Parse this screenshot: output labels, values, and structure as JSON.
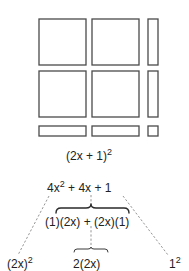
{
  "figure": {
    "area_model": {
      "caption": "(2x + 1)",
      "caption_exponent": "2",
      "tiles": [
        {
          "kind": "x-squared",
          "label": "large-square",
          "x": 39,
          "y": 19,
          "w": 47,
          "h": 46
        },
        {
          "kind": "x-squared",
          "label": "large-square",
          "x": 92,
          "y": 19,
          "w": 47,
          "h": 46
        },
        {
          "kind": "x",
          "label": "tall-strip",
          "x": 148,
          "y": 19,
          "w": 10,
          "h": 46
        },
        {
          "kind": "x-squared",
          "label": "large-square",
          "x": 39,
          "y": 71,
          "w": 47,
          "h": 46
        },
        {
          "kind": "x-squared",
          "label": "large-square",
          "x": 92,
          "y": 71,
          "w": 47,
          "h": 46
        },
        {
          "kind": "x",
          "label": "tall-strip",
          "x": 148,
          "y": 71,
          "w": 10,
          "h": 46
        },
        {
          "kind": "x",
          "label": "wide-strip",
          "x": 39,
          "y": 126,
          "w": 47,
          "h": 10
        },
        {
          "kind": "x",
          "label": "wide-strip",
          "x": 92,
          "y": 126,
          "w": 47,
          "h": 10
        },
        {
          "kind": "unit",
          "label": "unit-square",
          "x": 148,
          "y": 126,
          "w": 10,
          "h": 10
        }
      ]
    },
    "expansion": {
      "trinomial": {
        "term1": "4x",
        "term1_exponent": "2",
        "rest": " + 4x + 1"
      },
      "middle_products": "(1)(2x) + (2x)(1)",
      "left_leaf": {
        "base": "(2x)",
        "exponent": "2"
      },
      "middle_leaf": "2(2x)",
      "right_leaf": {
        "base": "1",
        "exponent": "2"
      }
    },
    "colors": {
      "stroke": "#4a4a4a",
      "text": "#222222",
      "dash": "#7a7a7a"
    }
  }
}
